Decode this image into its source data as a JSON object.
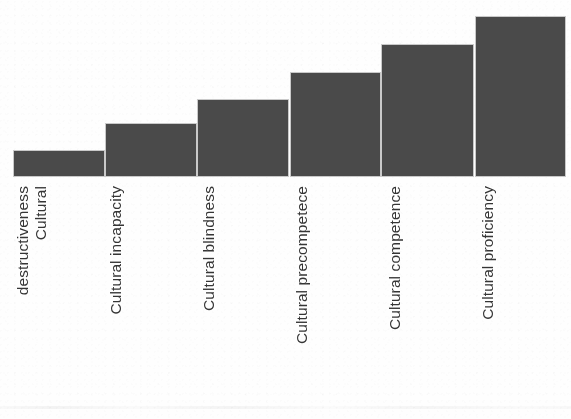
{
  "figure": {
    "background_color": "#fefefe",
    "bar_color": "#4a4a4a",
    "bar_border_color": "#c9c9c9",
    "label_color": "#353535"
  },
  "chart_data": {
    "type": "bar",
    "title": "",
    "subtitle": "",
    "xlabel": "",
    "ylabel": "",
    "grid": false,
    "legend": false,
    "axis_line_visible": false,
    "tick_labels_rotation_deg": 90,
    "orientation": "vertical",
    "ylim": [
      0,
      180
    ],
    "categories": [
      "Cultural destructiveness",
      "Cultural incapacity",
      "Cultural blindness",
      "Cultural precompetece",
      "Cultural competence",
      "Cultural proficiency"
    ],
    "category_lines": [
      [
        "Cultural",
        "destructiveness"
      ],
      [
        "Cultural incapacity"
      ],
      [
        "Cultural blindness"
      ],
      [
        "Cultural precompetece"
      ],
      [
        "Cultural competence"
      ],
      [
        "Cultural proficiency"
      ]
    ],
    "values": [
      27,
      54,
      78,
      105,
      133,
      161
    ],
    "bars": [
      {
        "category": "Cultural destructiveness",
        "value": 27,
        "left": 13,
        "width": 92,
        "height": 27
      },
      {
        "category": "Cultural incapacity",
        "value": 54,
        "left": 105,
        "width": 92,
        "height": 54
      },
      {
        "category": "Cultural blindness",
        "value": 78,
        "left": 197,
        "width": 92,
        "height": 78
      },
      {
        "category": "Cultural precompetece",
        "value": 105,
        "left": 290,
        "width": 91,
        "height": 105
      },
      {
        "category": "Cultural competence",
        "value": 133,
        "left": 381,
        "width": 93,
        "height": 133
      },
      {
        "category": "Cultural proficiency",
        "value": 161,
        "left": 475,
        "width": 91,
        "height": 161
      }
    ],
    "label_positions": [
      24,
      117,
      210,
      303,
      396,
      489
    ]
  }
}
